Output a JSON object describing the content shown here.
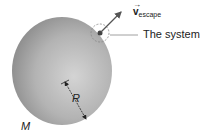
{
  "diagram": {
    "labels": {
      "velocity_symbol": "v",
      "velocity_subscript": "escape",
      "velocity_arrow": "→",
      "system": "The system",
      "radius": "R",
      "mass": "M"
    },
    "colors": {
      "sphere_light": "#d6d6d6",
      "sphere_dark": "#8e8e8e",
      "arrow": "#555555",
      "dashed_circle": "#888888",
      "particle": "#444444"
    }
  }
}
